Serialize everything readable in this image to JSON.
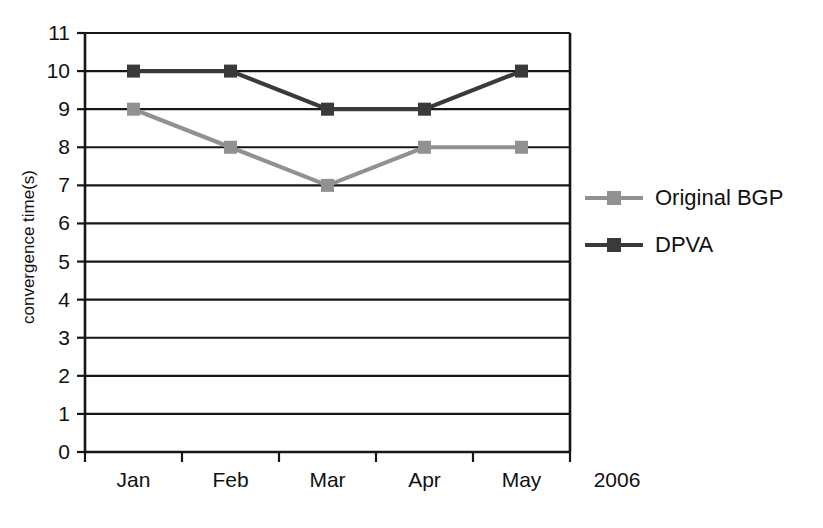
{
  "chart_data": {
    "type": "line",
    "title": "",
    "xlabel": "",
    "ylabel": "convergence time(s)",
    "categories": [
      "Jan",
      "Feb",
      "Mar",
      "Apr",
      "May"
    ],
    "x_axis_note": "2006",
    "ylim": [
      0,
      11
    ],
    "y_ticks": [
      0,
      1,
      2,
      3,
      4,
      5,
      6,
      7,
      8,
      9,
      10,
      11
    ],
    "grid": true,
    "legend_position": "right",
    "series": [
      {
        "name": "Original BGP",
        "values": [
          9,
          8,
          7,
          8,
          8
        ],
        "color": "#919191",
        "marker": "square"
      },
      {
        "name": "DPVA",
        "values": [
          10,
          10,
          9,
          9,
          10
        ],
        "color": "#3a3a3a",
        "marker": "square"
      }
    ]
  },
  "axis": {
    "y_tick_labels": [
      "0",
      "1",
      "2",
      "3",
      "4",
      "5",
      "6",
      "7",
      "8",
      "9",
      "10",
      "11"
    ],
    "x_tick_labels": [
      "Jan",
      "Feb",
      "Mar",
      "Apr",
      "May"
    ],
    "year": "2006",
    "y_title": "convergence time(s)"
  },
  "legend": {
    "items": [
      {
        "label": "Original BGP",
        "color": "#919191"
      },
      {
        "label": "DPVA",
        "color": "#3a3a3a"
      }
    ]
  },
  "colors": {
    "background": "#ffffff",
    "axis": "#161616",
    "grid": "#161616",
    "series_original_bgp": "#919191",
    "series_dpva": "#3a3a3a"
  }
}
